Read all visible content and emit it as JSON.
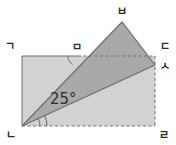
{
  "figure": {
    "background_color": "#ffffff",
    "rectangle": {
      "name": "rectangle-gnde-nd-rl",
      "fill_color": "#d2d2d2",
      "stroke_color": "#6e6e6e",
      "vertices": [
        {
          "label": "ㄱ",
          "x": 22,
          "y": 56,
          "corner": "top-left"
        },
        {
          "label": "ㄷ",
          "x": 155,
          "y": 56,
          "corner": "top-right"
        },
        {
          "label": "ㄹ",
          "x": 155,
          "y": 126,
          "corner": "bottom-right"
        },
        {
          "label": "ㄴ",
          "x": 22,
          "y": 126,
          "corner": "bottom-left"
        }
      ],
      "solid_edges": [
        "top",
        "left"
      ],
      "dashed_edges": [
        "right",
        "bottom"
      ]
    },
    "triangle": {
      "name": "triangle-n-b-s",
      "fill_color": "#a9a9a9",
      "stroke_color": "#6e6e6e",
      "vertices": [
        {
          "label": "ㄴ",
          "x": 22,
          "y": 126
        },
        {
          "label": "ㅂ",
          "x": 122,
          "y": 22
        },
        {
          "label": "ㅅ",
          "x": 155,
          "y": 65
        }
      ]
    },
    "intersection_point": {
      "label": "ㅁ",
      "x": 78,
      "y": 56,
      "note": "point where segment ㄴㅂ crosses top edge ㄱㄷ"
    },
    "angle": {
      "label": "25°",
      "value": 25,
      "unit": "degrees",
      "at_vertex": "ㄴ",
      "label_x": 65,
      "label_y": 100
    },
    "labels": {
      "top_left": "ㄱ",
      "top_mid": "ㅁ",
      "top_apex": "ㅂ",
      "right_top": "ㄷ",
      "right_inner": "ㅅ",
      "bottom_left": "ㄴ",
      "bottom_right": "ㄹ"
    }
  }
}
